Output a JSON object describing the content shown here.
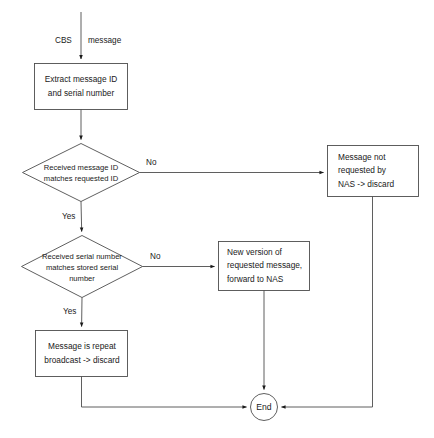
{
  "diagram": {
    "type": "flowchart",
    "stroke_color": "#4d4d4d",
    "text_color": "#1a1a1a",
    "background_color": "#ffffff",
    "nodes": {
      "start_edge_label": {
        "left": "CBS",
        "right": "message"
      },
      "extract": {
        "line1": "Extract message ID",
        "line2": "and serial number"
      },
      "decision_msg_id": {
        "line1": "Received message ID",
        "line2": "matches requested ID"
      },
      "not_requested": {
        "line1": "Message not",
        "line2": "requested by",
        "line3": "NAS -> discard"
      },
      "decision_serial": {
        "line1": "Received serial number",
        "line2": "matches stored serial",
        "line3": "number"
      },
      "new_version": {
        "line1": "New version of",
        "line2": "requested message,",
        "line3": "forward to NAS"
      },
      "repeat_broadcast": {
        "line1": "Message is repeat",
        "line2": "broadcast -> discard"
      },
      "end": {
        "label": "End"
      }
    },
    "edges": {
      "msg_id_no": "No",
      "msg_id_yes": "Yes",
      "serial_no": "No",
      "serial_yes": "Yes"
    }
  }
}
